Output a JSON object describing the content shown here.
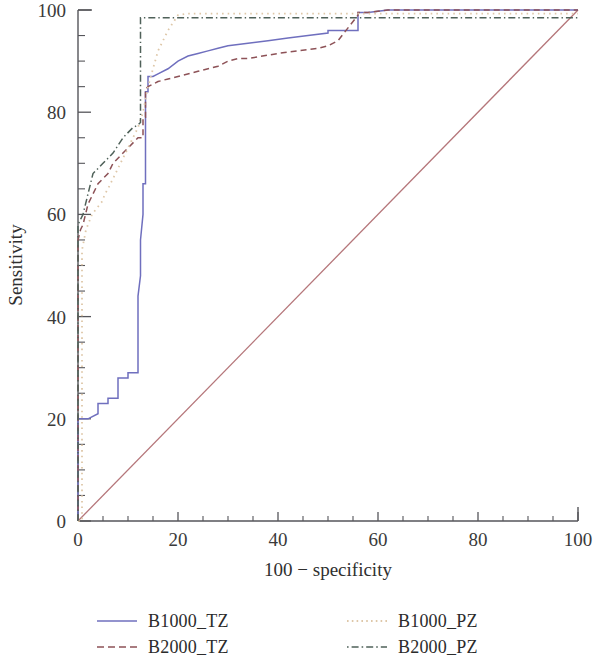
{
  "chart_data": {
    "type": "line",
    "title": "",
    "subtitle": "",
    "xlabel": "100 − specificity",
    "ylabel": "Sensitivity",
    "xlim": [
      0,
      100
    ],
    "ylim": [
      0,
      100
    ],
    "xticks": [
      0,
      20,
      40,
      60,
      80,
      100
    ],
    "yticks": [
      0,
      20,
      40,
      60,
      80,
      100
    ],
    "xtick_labels": [
      "0",
      "20",
      "40",
      "60",
      "80",
      "100"
    ],
    "ytick_labels": [
      "0",
      "20",
      "40",
      "60",
      "80",
      "100"
    ],
    "minor_tick_step": 5,
    "grid": false,
    "legend_position": "below",
    "reference_line": {
      "name": "chance-diagonal",
      "x": [
        0,
        100
      ],
      "y": [
        0,
        100
      ],
      "color": "#b5767a",
      "dash": "none",
      "width": 1.3
    },
    "series": [
      {
        "name": "B1000_TZ",
        "color": "#6f6fbe",
        "dash": "solid",
        "width": 1.5,
        "x": [
          0,
          0,
          2,
          2,
          4,
          4,
          6,
          6,
          8,
          8,
          10,
          10,
          12,
          12,
          12.5,
          12.5,
          13,
          13,
          13.5,
          13.5,
          14,
          14,
          15,
          16,
          18,
          20,
          22,
          24,
          26,
          28,
          30,
          34,
          38,
          42,
          46,
          50,
          50,
          54,
          56,
          56,
          58,
          62,
          70,
          80,
          90,
          100
        ],
        "y": [
          0,
          20,
          20,
          20,
          21,
          23,
          23,
          24,
          24,
          28,
          28,
          29,
          29,
          44,
          48,
          55,
          60,
          66,
          66,
          84,
          84,
          87,
          87,
          87.5,
          88.5,
          90,
          91,
          91.5,
          92,
          92.5,
          93,
          93.5,
          94,
          94.5,
          95,
          95.5,
          96,
          96,
          96,
          99.5,
          99.5,
          100,
          100,
          100,
          100,
          100
        ]
      },
      {
        "name": "B2000_TZ",
        "color": "#8d5257",
        "dash": "dashed",
        "width": 1.5,
        "x": [
          0,
          0,
          0.5,
          1,
          1.5,
          2,
          3,
          4,
          5,
          6,
          7,
          8,
          9,
          10,
          11,
          12,
          13,
          13,
          13.5,
          13.5,
          14,
          16,
          18,
          20,
          24,
          28,
          30,
          32,
          34,
          40,
          44,
          48,
          50,
          50,
          52,
          54,
          56,
          56,
          58,
          62,
          66,
          80,
          100
        ],
        "y": [
          0,
          55,
          57,
          58,
          60,
          62,
          64,
          66,
          67,
          68,
          70,
          71,
          72,
          73,
          74,
          75,
          75,
          79,
          79,
          84.5,
          85,
          86,
          86.5,
          87,
          88,
          89,
          90,
          90.5,
          90.5,
          91.5,
          92,
          92.5,
          93,
          93,
          94,
          96.5,
          99,
          99.5,
          99.5,
          100,
          100,
          100,
          100
        ]
      },
      {
        "name": "B1000_PZ",
        "color": "#dec7a8",
        "dash": "dotted",
        "width": 1.8,
        "x": [
          0,
          0.8,
          0.8,
          1.2,
          1.6,
          2,
          2.4,
          2.8,
          3.2,
          3.6,
          4,
          4.4,
          4.8,
          5,
          5.4,
          6,
          7,
          8,
          9,
          10,
          11,
          12,
          13,
          14,
          16,
          18,
          20,
          22,
          100
        ],
        "y": [
          0,
          0,
          53,
          55,
          57,
          58,
          59,
          60,
          60.5,
          61,
          61.5,
          62,
          62.5,
          63,
          64,
          65,
          67,
          69,
          71,
          73,
          75,
          77,
          80,
          85,
          92,
          96,
          99,
          99.3,
          99.3
        ]
      },
      {
        "name": "B2000_PZ",
        "color": "#4f6159",
        "dash": "dashdot",
        "width": 1.5,
        "x": [
          0,
          0,
          0.5,
          1,
          1.5,
          2,
          2.5,
          3,
          4,
          5,
          6,
          7,
          8,
          9,
          10,
          11,
          12,
          12.5,
          12.5,
          14,
          20,
          40,
          60,
          80,
          100
        ],
        "y": [
          0,
          58,
          59,
          60,
          62,
          64,
          66,
          68,
          69,
          70,
          71,
          72,
          73.5,
          75,
          76,
          77,
          77.5,
          78,
          98.5,
          98.5,
          98.5,
          98.5,
          98.5,
          98.5,
          98.5
        ]
      }
    ]
  },
  "legend": {
    "entries": [
      {
        "label": "B1000_TZ",
        "color": "#6f6fbe",
        "dash": "solid"
      },
      {
        "label": "B2000_TZ",
        "color": "#8d5257",
        "dash": "dashed"
      },
      {
        "label": "B1000_PZ",
        "color": "#dec7a8",
        "dash": "dotted"
      },
      {
        "label": "B2000_PZ",
        "color": "#4f6159",
        "dash": "dashdot"
      }
    ]
  },
  "colors": {
    "axis": "#55555a",
    "text": "#3a3a3a",
    "background": "#ffffff"
  }
}
